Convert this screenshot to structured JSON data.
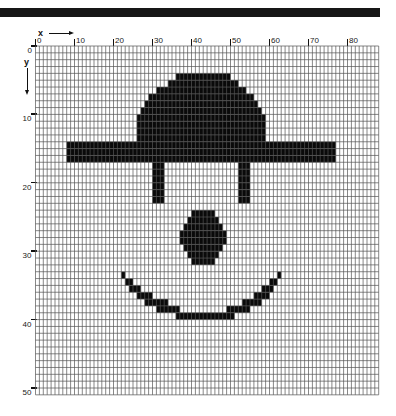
{
  "header_bar": {
    "color": "#161616"
  },
  "axes": {
    "x_label": "x",
    "y_label": "y",
    "x_ticks": [
      "0",
      "10",
      "20",
      "30",
      "40",
      "50",
      "60",
      "70",
      "80"
    ],
    "y_ticks": [
      "0",
      "10",
      "20",
      "30",
      "40",
      "50"
    ]
  },
  "grid": {
    "columns": 88,
    "rows": 51,
    "origin_px": [
      35.5,
      46
    ],
    "cell_w": 3.9,
    "cell_h": 6.84,
    "line_color": "#555555",
    "fill_color": "#0a0a0a"
  },
  "figure": {
    "filled_runs": [
      {
        "part": "hat-dome",
        "row": 4,
        "from": 36,
        "to": 49
      },
      {
        "part": "hat-dome",
        "row": 5,
        "from": 34,
        "to": 51
      },
      {
        "part": "hat-dome",
        "row": 6,
        "from": 31,
        "to": 53
      },
      {
        "part": "hat-dome",
        "row": 7,
        "from": 29,
        "to": 55
      },
      {
        "part": "hat-dome",
        "row": 8,
        "from": 28,
        "to": 56
      },
      {
        "part": "hat-dome",
        "row": 9,
        "from": 27,
        "to": 57
      },
      {
        "part": "hat-dome",
        "row": 10,
        "from": 26,
        "to": 58
      },
      {
        "part": "hat-dome",
        "row": 11,
        "from": 26,
        "to": 58
      },
      {
        "part": "hat-dome",
        "row": 12,
        "from": 26,
        "to": 58
      },
      {
        "part": "hat-dome",
        "row": 13,
        "from": 26,
        "to": 58
      },
      {
        "part": "hat-brim",
        "row": 14,
        "from": 8,
        "to": 76
      },
      {
        "part": "hat-brim",
        "row": 15,
        "from": 8,
        "to": 76
      },
      {
        "part": "hat-brim",
        "row": 16,
        "from": 8,
        "to": 76
      },
      {
        "part": "left-eye",
        "row": 17,
        "from": 30,
        "to": 32
      },
      {
        "part": "left-eye",
        "row": 18,
        "from": 30,
        "to": 32
      },
      {
        "part": "left-eye",
        "row": 19,
        "from": 30,
        "to": 32
      },
      {
        "part": "left-eye",
        "row": 20,
        "from": 30,
        "to": 32
      },
      {
        "part": "left-eye",
        "row": 21,
        "from": 30,
        "to": 32
      },
      {
        "part": "left-eye",
        "row": 22,
        "from": 30,
        "to": 32
      },
      {
        "part": "right-eye",
        "row": 17,
        "from": 52,
        "to": 54
      },
      {
        "part": "right-eye",
        "row": 18,
        "from": 52,
        "to": 54
      },
      {
        "part": "right-eye",
        "row": 19,
        "from": 52,
        "to": 54
      },
      {
        "part": "right-eye",
        "row": 20,
        "from": 52,
        "to": 54
      },
      {
        "part": "right-eye",
        "row": 21,
        "from": 52,
        "to": 54
      },
      {
        "part": "right-eye",
        "row": 22,
        "from": 52,
        "to": 54
      },
      {
        "part": "nose",
        "row": 24,
        "from": 40,
        "to": 45
      },
      {
        "part": "nose",
        "row": 25,
        "from": 39,
        "to": 46
      },
      {
        "part": "nose",
        "row": 26,
        "from": 38,
        "to": 47
      },
      {
        "part": "nose",
        "row": 27,
        "from": 37,
        "to": 48
      },
      {
        "part": "nose",
        "row": 28,
        "from": 37,
        "to": 48
      },
      {
        "part": "nose",
        "row": 29,
        "from": 38,
        "to": 47
      },
      {
        "part": "nose",
        "row": 30,
        "from": 39,
        "to": 46
      },
      {
        "part": "nose",
        "row": 31,
        "from": 40,
        "to": 45
      },
      {
        "part": "mouth",
        "row": 33,
        "from": 22,
        "to": 22
      },
      {
        "part": "mouth",
        "row": 33,
        "from": 62,
        "to": 62
      },
      {
        "part": "mouth",
        "row": 34,
        "from": 23,
        "to": 24
      },
      {
        "part": "mouth",
        "row": 34,
        "from": 60,
        "to": 61
      },
      {
        "part": "mouth",
        "row": 35,
        "from": 24,
        "to": 26
      },
      {
        "part": "mouth",
        "row": 35,
        "from": 58,
        "to": 60
      },
      {
        "part": "mouth",
        "row": 36,
        "from": 26,
        "to": 29
      },
      {
        "part": "mouth",
        "row": 36,
        "from": 56,
        "to": 59
      },
      {
        "part": "mouth",
        "row": 37,
        "from": 28,
        "to": 33
      },
      {
        "part": "mouth",
        "row": 37,
        "from": 53,
        "to": 57
      },
      {
        "part": "mouth",
        "row": 38,
        "from": 31,
        "to": 36
      },
      {
        "part": "mouth",
        "row": 38,
        "from": 49,
        "to": 54
      },
      {
        "part": "mouth",
        "row": 39,
        "from": 36,
        "to": 50
      }
    ]
  }
}
